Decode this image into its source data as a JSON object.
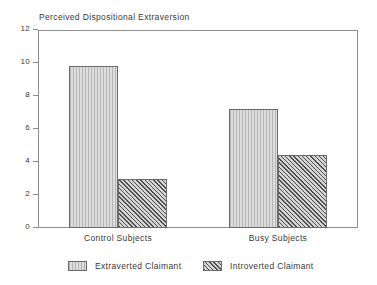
{
  "chart_data": {
    "type": "bar",
    "title": "Perceived Dispositional Extraversion",
    "xlabel": "",
    "ylabel": "",
    "ylim": [
      0,
      12
    ],
    "yticks": [
      0,
      2,
      4,
      6,
      8,
      10,
      12
    ],
    "ytick_labels": [
      "0",
      "2",
      "4",
      "6",
      "8",
      "10",
      "12"
    ],
    "grid": false,
    "legend_position": "bottom",
    "categories": [
      "Control Subjects",
      "Busy Subjects"
    ],
    "series": [
      {
        "name": "Extraverted Claimant",
        "values": [
          9.8,
          7.2
        ],
        "fill": "light-vertical-hatch",
        "color": "#dcdcdc"
      },
      {
        "name": "Introverted Claimant",
        "values": [
          2.95,
          4.4
        ],
        "fill": "dark-crosshatch",
        "color": "#8a8a8a"
      }
    ]
  },
  "axes": {
    "frame_color": "#8e8e8e",
    "text_color": "#3a3a3a"
  }
}
